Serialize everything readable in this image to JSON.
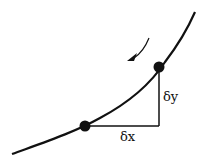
{
  "diagram": {
    "labels": {
      "dx": "δx",
      "dy": "δy"
    },
    "elements": {
      "curve": "increasing convex curve",
      "points": [
        "lower point",
        "upper point"
      ],
      "arrow": "direction arrow pointing down-left along curve"
    },
    "colors": {
      "stroke": "#111111",
      "background": "#ffffff"
    }
  }
}
